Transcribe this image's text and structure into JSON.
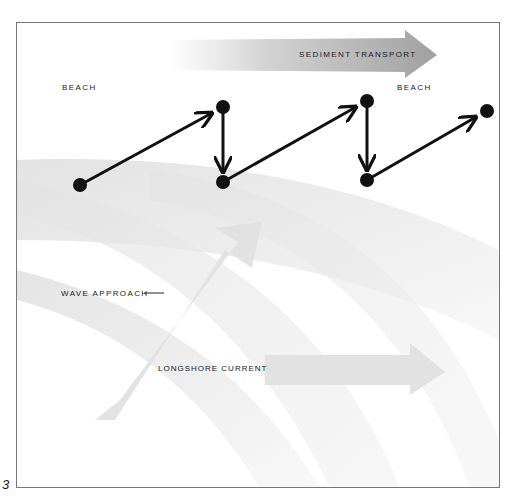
{
  "figure": {
    "number": "3"
  },
  "labels": {
    "beach_left": "BEACH",
    "beach_right": "BEACH",
    "sediment_transport": "SEDIMENT TRANSPORT",
    "wave_approach": "WAVE APPROACH",
    "longshore_current": "LONGSHORE CURRENT"
  },
  "particle_path": {
    "points": [
      {
        "x": 80,
        "y": 185
      },
      {
        "x": 223,
        "y": 107
      },
      {
        "x": 223,
        "y": 182
      },
      {
        "x": 367,
        "y": 101
      },
      {
        "x": 367,
        "y": 180
      },
      {
        "x": 487,
        "y": 111
      }
    ],
    "color": "#111111"
  },
  "colors": {
    "wave_band": "#e6e6e6",
    "arrow_fill": "#dcdcdc",
    "sediment_arrow": "#a8a8a8",
    "frame_border": "#777777"
  }
}
